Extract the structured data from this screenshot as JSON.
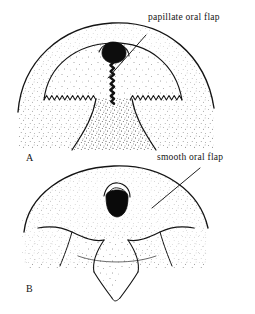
{
  "figure": {
    "background_color": "#ffffff",
    "ink_color": "#141414",
    "width": 255,
    "height": 314,
    "type": "scientific-line-illustration"
  },
  "labels": {
    "papillate": "papillate oral flap",
    "smooth": "smooth oral flap"
  },
  "panels": [
    {
      "letter": "A",
      "subject": "papillate oral flap",
      "margin_style": "serrated",
      "features": [
        "outer dome arc",
        "inner dome arc",
        "dark bulbous knob",
        "zigzag vertical stalk",
        "sawtooth flap margin",
        "tapering neck",
        "stippled shading"
      ]
    },
    {
      "letter": "B",
      "subject": "smooth oral flap",
      "margin_style": "smooth",
      "features": [
        "broad dome arc",
        "dark oval mouth opening",
        "paired crescent flaps",
        "V-shaped throat",
        "converging chin folds",
        "stippled shading"
      ]
    }
  ],
  "leaders": [
    {
      "name": "papillate-leader",
      "from_label": "papillate oral flap",
      "to_panel": "A"
    },
    {
      "name": "smooth-leader",
      "from_label": "smooth oral flap",
      "to_panel": "B"
    }
  ]
}
